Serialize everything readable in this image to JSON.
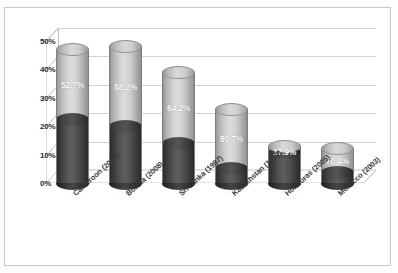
{
  "chart": {
    "title": "",
    "ylabel": "",
    "xlabel": ""
  },
  "chart_data": {
    "type": "bar",
    "subtype": "stacked-3d-cylinder",
    "title": "",
    "xlabel": "",
    "ylabel": "",
    "ylim": [
      0,
      50
    ],
    "ytick_labels": [
      "0%",
      "10%",
      "20%",
      "30%",
      "40%",
      "50%"
    ],
    "ytick_values": [
      0,
      10,
      20,
      30,
      40,
      50
    ],
    "grid": true,
    "legend": "none",
    "categories": [
      "Cameroon (2004)",
      "Bolivia (2008)",
      "Sri Lanka (1987)",
      "Kazakhstan (1999)",
      "Honduras (2005)",
      "Morocco (2003)"
    ],
    "series": [
      {
        "name": "lower-segment",
        "color": "#4a4a4a",
        "values": [
          22.2,
          20.0,
          13.9,
          5.0,
          10.7,
          3.6
        ]
      },
      {
        "name": "upper-segment",
        "color": "#cfcfcf",
        "values": [
          24.8,
          27.9,
          24.9,
          20.9,
          2.3,
          8.5
        ]
      }
    ],
    "totals": [
      47.0,
      47.9,
      38.8,
      25.9,
      13.0,
      12.1
    ],
    "data_labels": [
      "52.7%",
      "58.2%",
      "64.2%",
      "80.7%",
      "17.9%",
      "70.4%"
    ],
    "data_label_meaning": "share of total represented by the light upper segment"
  },
  "bars": [
    {
      "category": "Cameroon (2004)",
      "label": "52.7%",
      "total": 47.0,
      "dark": 22.2,
      "light": 24.8
    },
    {
      "category": "Bolivia (2008)",
      "label": "58.2%",
      "total": 47.9,
      "dark": 20.0,
      "light": 27.9
    },
    {
      "category": "Sri Lanka (1987)",
      "label": "64.2%",
      "total": 38.8,
      "dark": 13.9,
      "light": 24.9
    },
    {
      "category": "Kazakhstan (1999)",
      "label": "80.7%",
      "total": 25.9,
      "dark": 5.0,
      "light": 20.9
    },
    {
      "category": "Honduras (2005)",
      "label": "17.9%",
      "total": 13.0,
      "dark": 10.7,
      "light": 2.3
    },
    {
      "category": "Morocco (2003)",
      "label": "70.4%",
      "total": 12.1,
      "dark": 3.6,
      "light": 8.5
    }
  ],
  "colors": {
    "light_segment": "#cfcfcf",
    "dark_segment": "#4a4a4a",
    "gridline": "#d2d2d2",
    "axis": "#bdbdbd",
    "frame": "#c9c9c9",
    "label_text": "#ffffff",
    "tick_text": "#2b2b2b"
  }
}
